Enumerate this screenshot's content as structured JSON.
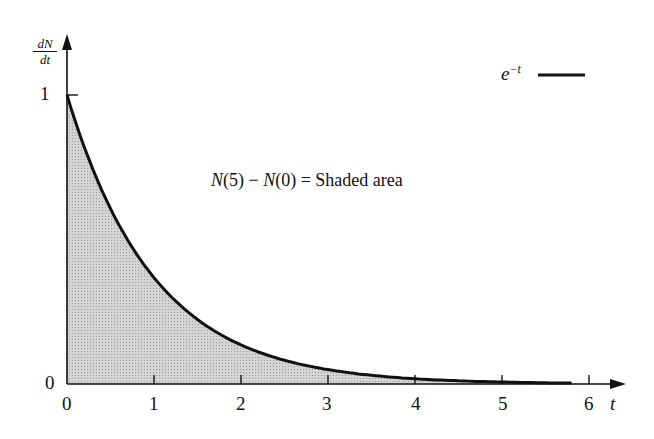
{
  "chart_data": {
    "type": "area",
    "function": "e^{-t}",
    "title": "",
    "xlabel": "t",
    "ylabel": "dN/dt",
    "ylabel_num": "dN",
    "ylabel_den": "dt",
    "x_ticks": [
      "0",
      "1",
      "2",
      "3",
      "4",
      "5",
      "6"
    ],
    "y_ticks": [
      "0",
      "1"
    ],
    "xlim": [
      0,
      6.3
    ],
    "ylim": [
      0,
      1.35
    ],
    "x": [
      0,
      0.5,
      1,
      1.5,
      2,
      2.5,
      3,
      3.5,
      4,
      4.5,
      5,
      5.5,
      5.8
    ],
    "values": [
      1,
      0.607,
      0.368,
      0.223,
      0.135,
      0.082,
      0.05,
      0.03,
      0.018,
      0.011,
      0.007,
      0.004,
      0.003
    ],
    "shaded_region": [
      0,
      5.8
    ],
    "legend": [
      {
        "label": "e^{-t}",
        "style": "solid black line"
      }
    ],
    "legend_position": "top-right",
    "annotation": "N(5) − N(0) = Shaded area",
    "grid": false,
    "colors": {
      "curve": "#111111",
      "fill": "#c8c8c8"
    }
  },
  "labels": {
    "ylabel_num": "dN",
    "ylabel_den": "dt",
    "xlabel": "t",
    "y1": "1",
    "y0": "0",
    "x0": "0",
    "x1": "1",
    "x2": "2",
    "x3": "3",
    "x4": "4",
    "x5": "5",
    "x6": "6",
    "legend_e": "e",
    "legend_exp": "−t",
    "annotation_a": "N",
    "annotation_b": "(5) − ",
    "annotation_c": "N",
    "annotation_d": "(0) = Shaded area"
  }
}
